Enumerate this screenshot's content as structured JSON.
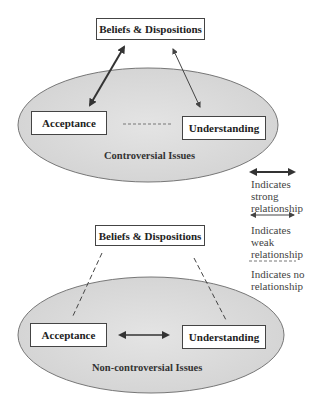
{
  "top_diagram": {
    "beliefs_label": "Beliefs & Dispositions",
    "acceptance_label": "Acceptance",
    "understanding_label": "Understanding",
    "context_label": "Controversial Issues",
    "relations": {
      "beliefs_acceptance": "strong",
      "beliefs_understanding": "weak",
      "acceptance_understanding": "none"
    }
  },
  "bottom_diagram": {
    "beliefs_label": "Beliefs & Dispositions",
    "acceptance_label": "Acceptance",
    "understanding_label": "Understanding",
    "context_label": "Non-controversial Issues",
    "relations": {
      "beliefs_acceptance": "none",
      "beliefs_understanding": "none",
      "acceptance_understanding": "strong"
    }
  },
  "legend": {
    "strong": "Indicates strong relationship",
    "weak": "Indicates weak relationship",
    "none": "Indicates no relationship"
  },
  "colors": {
    "ellipse_fill": "#dcdcdc",
    "line": "#333333"
  }
}
